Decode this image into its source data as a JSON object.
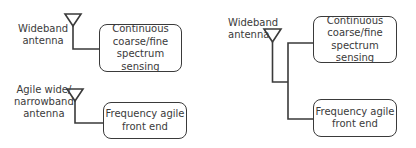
{
  "diagram": {
    "left_panel": {
      "antennas": [
        {
          "label_lines": [
            "Wideband",
            "antenna"
          ]
        },
        {
          "label_lines": [
            "Agile wide/",
            "narrowband",
            "antenna"
          ]
        }
      ],
      "blocks": [
        {
          "lines": [
            "Continuous",
            "coarse/fine",
            "spectrum sensing"
          ]
        },
        {
          "lines": [
            "Frequency agile",
            "front end"
          ]
        }
      ]
    },
    "right_panel": {
      "antennas": [
        {
          "label_lines": [
            "Wideband",
            "antenna"
          ]
        }
      ],
      "blocks": [
        {
          "lines": [
            "Continuous",
            "coarse/fine",
            "spectrum sensing"
          ]
        },
        {
          "lines": [
            "Frequency agile",
            "front end"
          ]
        }
      ]
    },
    "colors": {
      "stroke": "#3a3a3a",
      "text": "#3a3a3a",
      "background": "#ffffff"
    }
  }
}
